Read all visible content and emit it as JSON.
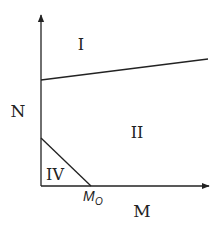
{
  "diagram": {
    "axes": {
      "y_label": "N",
      "x_label": "M"
    },
    "regions": [
      {
        "id": "I",
        "label": "I"
      },
      {
        "id": "II",
        "label": "II"
      },
      {
        "id": "IV",
        "label": "IV"
      }
    ],
    "markers": {
      "x_intercept_main": "M",
      "x_intercept_sub": "O"
    },
    "colors": {
      "line": "#222222",
      "background": "#ffffff"
    }
  }
}
